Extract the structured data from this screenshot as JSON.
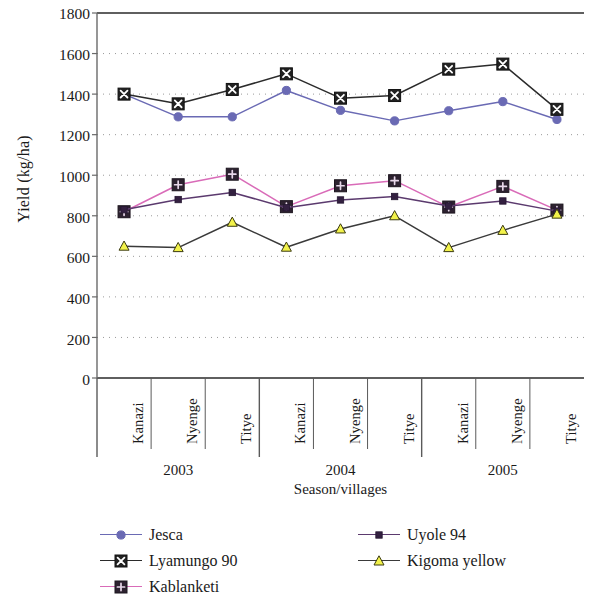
{
  "chart_data": {
    "type": "line",
    "title": "",
    "xlabel": "Season/villages",
    "ylabel": "Yield (kg/ha)",
    "ylim": [
      0,
      1800
    ],
    "ytick_step": 200,
    "yticks": [
      1800,
      1600,
      1400,
      1200,
      1000,
      800,
      600,
      400,
      200,
      0
    ],
    "grid": true,
    "grid_style": "dotted",
    "legend_position": "bottom",
    "groups": [
      {
        "year": "2003",
        "villages": [
          "Kanazi",
          "Nyenge",
          "Titye"
        ]
      },
      {
        "year": "2004",
        "villages": [
          "Kanazi",
          "Nyenge",
          "Titye"
        ]
      },
      {
        "year": "2005",
        "villages": [
          "Kanazi",
          "Nyenge",
          "Titye"
        ]
      }
    ],
    "categories": [
      "2003 Kanazi",
      "2003 Nyenge",
      "2003 Titye",
      "2004 Kanazi",
      "2004 Nyenge",
      "2004 Titye",
      "2005 Kanazi",
      "2005 Nyenge",
      "2005 Titye"
    ],
    "series": [
      {
        "name": "Jesca",
        "color": "#6a6ab4",
        "marker": "circle",
        "values": [
          1400,
          1288,
          1288,
          1418,
          1320,
          1268,
          1318,
          1363,
          1275
        ]
      },
      {
        "name": "Lyamungo 90",
        "color": "#2b2b2b",
        "marker": "square-x",
        "values": [
          1400,
          1352,
          1423,
          1500,
          1380,
          1393,
          1523,
          1548,
          1325
        ]
      },
      {
        "name": "Kablanketi",
        "color": "#d96bb8",
        "marker": "square-plus",
        "values": [
          820,
          953,
          1005,
          845,
          948,
          973,
          843,
          945,
          828
        ]
      },
      {
        "name": "Uyole 94",
        "color": "#5b3a6e",
        "marker": "small-square",
        "values": [
          830,
          880,
          915,
          840,
          878,
          895,
          848,
          873,
          823
        ]
      },
      {
        "name": "Kigoma yellow",
        "color": "#3a3a3a",
        "marker": "triangle",
        "marker_fill": "#f2f24a",
        "values": [
          650,
          643,
          768,
          645,
          735,
          800,
          643,
          728,
          808
        ]
      }
    ]
  },
  "legend": {
    "items": [
      {
        "label": "Jesca"
      },
      {
        "label": "Lyamungo 90"
      },
      {
        "label": "Kablanketi"
      },
      {
        "label": "Uyole 94"
      },
      {
        "label": "Kigoma yellow"
      }
    ]
  }
}
